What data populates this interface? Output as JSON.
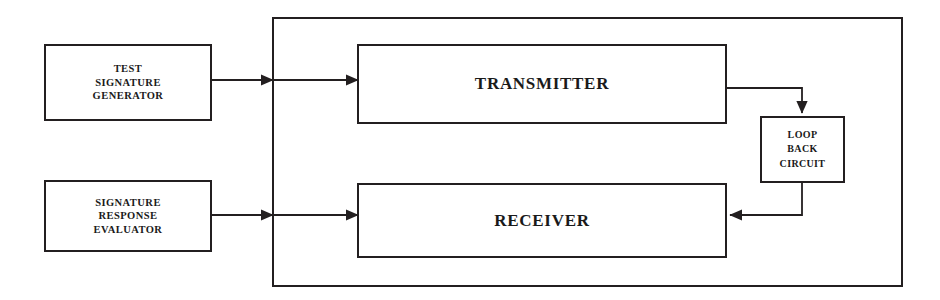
{
  "diagram": {
    "type": "block-diagram",
    "colors": {
      "stroke": "#231f20",
      "text": "#1a1a1a",
      "background": "#ffffff"
    },
    "nodes": [
      {
        "id": "test-signature-generator",
        "label": "TEST\nSIGNATURE\nGENERATOR",
        "inside_enclosure": false
      },
      {
        "id": "signature-response-evaluator",
        "label": "SIGNATURE\nRESPONSE\nEVALUATOR",
        "inside_enclosure": false
      },
      {
        "id": "transmitter",
        "label": "TRANSMITTER",
        "inside_enclosure": true
      },
      {
        "id": "receiver",
        "label": "RECEIVER",
        "inside_enclosure": true
      },
      {
        "id": "loop-back-circuit",
        "label": "LOOP\nBACK\nCIRCUIT",
        "inside_enclosure": true
      }
    ],
    "enclosure": {
      "id": "system-enclosure",
      "label": ""
    },
    "connections": [
      {
        "id": "generator-to-transmitter",
        "from": "test-signature-generator",
        "to": "transmitter",
        "arrowheads": 2,
        "direction": "right"
      },
      {
        "id": "evaluator-to-receiver",
        "from": "signature-response-evaluator",
        "to": "receiver",
        "arrowheads": 2,
        "direction": "right"
      },
      {
        "id": "transmitter-to-loop-back",
        "from": "transmitter",
        "to": "loop-back-circuit",
        "arrowheads": 1,
        "direction": "down"
      },
      {
        "id": "loop-back-to-receiver",
        "from": "loop-back-circuit",
        "to": "receiver",
        "arrowheads": 1,
        "direction": "left"
      }
    ]
  }
}
